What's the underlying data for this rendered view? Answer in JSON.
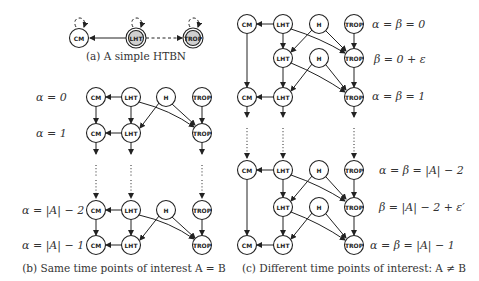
{
  "panels": {
    "a": {
      "caption": "(a) A simple HTBN",
      "nodes": [
        {
          "id": "CM",
          "label": "CM",
          "x": 79,
          "y": 38,
          "shaded": false
        },
        {
          "id": "LHT",
          "label": "LHT",
          "x": 136,
          "y": 38,
          "shaded": true
        },
        {
          "id": "TROP",
          "label": "TROP",
          "x": 193,
          "y": 38,
          "shaded": true
        }
      ]
    },
    "b": {
      "caption": "(b) Same time points of interest A = B",
      "row_labels": [
        "α = 0",
        "α = 1",
        "α = |A| − 2",
        "α = |A| − 1"
      ]
    },
    "c": {
      "caption": "(c) Different time points of interest: A ≠ B",
      "row_labels": [
        "α = β = 0",
        "β = 0 + ε",
        "α = β = 1",
        "α = β = |A| − 2",
        "β = |A| − 2 + ε′",
        "α = β = |A| − 1"
      ]
    }
  },
  "node_labels": {
    "cm": "CM",
    "lht": "LHT",
    "h": "H",
    "trop": "TROP"
  },
  "colors": {
    "stroke": "#222222",
    "shaded_fill": "#d0d0d0",
    "text": "#333333"
  }
}
